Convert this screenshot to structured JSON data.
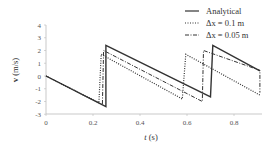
{
  "chart_data": {
    "type": "line",
    "title": "",
    "xlabel": "t (s)",
    "ylabel": "v (m/s)",
    "xlim": [
      0,
      0.9
    ],
    "ylim": [
      -3,
      4
    ],
    "xticks": [
      "0",
      "0.2",
      "0.4",
      "0.6",
      "0.8"
    ],
    "yticks": [
      "4",
      "3",
      "2",
      "1",
      "0",
      "-1",
      "-2",
      "-3"
    ],
    "grid": false,
    "legend_position": "upper right",
    "series": [
      {
        "name": "Analytical",
        "style": "solid",
        "x": [
          0,
          0.255,
          0.255,
          0.7,
          0.71,
          0.91
        ],
        "y": [
          0,
          -2.4,
          2.4,
          -1.65,
          2.4,
          0.4
        ]
      },
      {
        "name": "Δx = 0.1 m",
        "style": "dotted",
        "x": [
          0,
          0.225,
          0.235,
          0.58,
          0.595,
          0.91,
          0.91
        ],
        "y": [
          0,
          -2.1,
          1.7,
          -1.8,
          1.7,
          -1.5,
          -1.5
        ]
      },
      {
        "name": "Δx = 0.05 m",
        "style": "dashdot",
        "x": [
          0,
          0.24,
          0.245,
          0.665,
          0.67,
          0.91,
          0.91
        ],
        "y": [
          0,
          -2.25,
          2.0,
          -2.0,
          2.0,
          0.45,
          -1.3
        ]
      }
    ]
  },
  "axes": {
    "xlabel_italic": "t",
    "xlabel_unit": "(s)",
    "ylabel_bold": "v",
    "ylabel_unit": "(m/s)"
  },
  "legend": {
    "items": [
      {
        "label": "Analytical"
      },
      {
        "label": "Δx = 0.1 m"
      },
      {
        "label": "Δx = 0.05 m"
      }
    ]
  }
}
